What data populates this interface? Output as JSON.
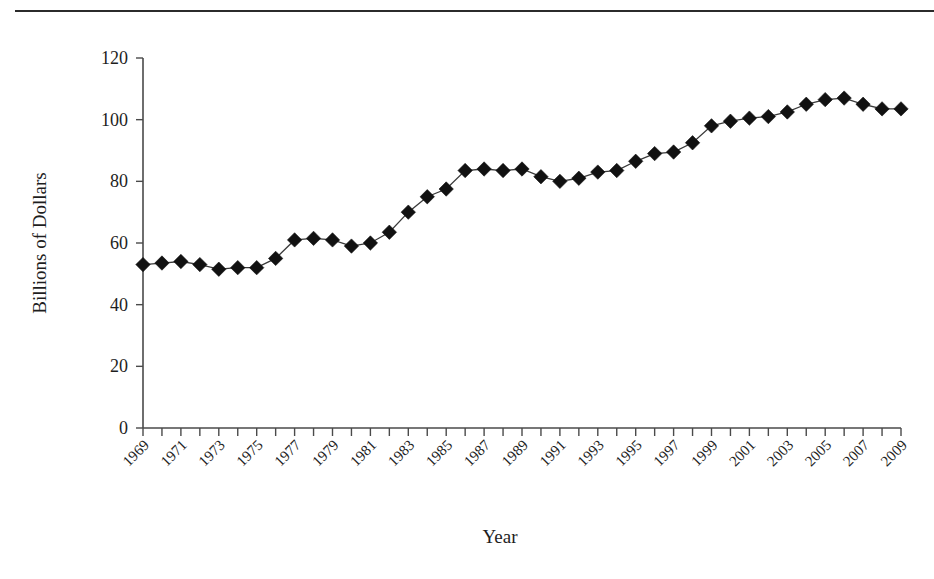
{
  "chart_data": {
    "type": "line",
    "title": "",
    "xlabel": "Year",
    "ylabel": "Billions of Dollars",
    "xlim": [
      1969,
      2009
    ],
    "ylim": [
      0,
      120
    ],
    "yticks": [
      0,
      20,
      40,
      60,
      80,
      100,
      120
    ],
    "xticks": [
      1969,
      1971,
      1973,
      1975,
      1977,
      1979,
      1981,
      1983,
      1985,
      1987,
      1989,
      1991,
      1993,
      1995,
      1997,
      1999,
      2001,
      2003,
      2005,
      2007,
      2009
    ],
    "xtick_labels": [
      "1969",
      "1971",
      "1973",
      "1975",
      "1977",
      "1979",
      "1981",
      "1983",
      "1985",
      "1987",
      "1989",
      "1991",
      "1993",
      "1995",
      "1997",
      "1999",
      "2001",
      "2003",
      "2005",
      "2007",
      "2009"
    ],
    "ytick_labels": [
      "0",
      "20",
      "40",
      "60",
      "80",
      "100",
      "120"
    ],
    "grid": false,
    "legend": false,
    "marker": "diamond",
    "marker_color": "#111111",
    "line_color": "#3a3a3a",
    "x": [
      1969,
      1970,
      1971,
      1972,
      1973,
      1974,
      1975,
      1976,
      1977,
      1978,
      1979,
      1980,
      1981,
      1982,
      1983,
      1984,
      1985,
      1986,
      1987,
      1988,
      1989,
      1990,
      1991,
      1992,
      1993,
      1994,
      1995,
      1996,
      1997,
      1998,
      1999,
      2000,
      2001,
      2002,
      2003,
      2004,
      2005,
      2006,
      2007,
      2008,
      2009
    ],
    "values": [
      53,
      53.5,
      54,
      53,
      51.5,
      52,
      52,
      55,
      61,
      61.5,
      61,
      59,
      60,
      63.5,
      70,
      75,
      77.5,
      83.5,
      84,
      83.5,
      84,
      81.5,
      80,
      81,
      83,
      83.5,
      86.5,
      89,
      89.5,
      92.5,
      98,
      99.5,
      100.5,
      101,
      102.5,
      105,
      106.5,
      107,
      105,
      103.5,
      103.5
    ],
    "series_name": "Billions of Dollars"
  },
  "figure": {
    "axis_color": "#4a4a4a",
    "background": "#ffffff",
    "rule_color": "#2b2b2b"
  }
}
